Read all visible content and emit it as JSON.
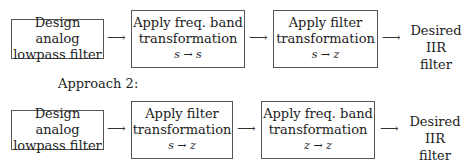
{
  "arrow_glyph": "⟶",
  "approach1": {
    "steps": [
      {
        "line1": "Design analog",
        "line2": "lowpass filter"
      },
      {
        "line1": "Apply freq. band",
        "line2": "transformation",
        "mapping": "s → s"
      },
      {
        "line1": "Apply filter",
        "line2": "transformation",
        "mapping": "s → z"
      }
    ],
    "output": {
      "line1": "Desired IIR",
      "line2": "filter"
    }
  },
  "approach2": {
    "heading": "Approach 2:",
    "steps": [
      {
        "line1": "Design analog",
        "line2": "lowpass filter"
      },
      {
        "line1": "Apply filter",
        "line2": "transformation",
        "mapping": "s → z"
      },
      {
        "line1": "Apply freq. band",
        "line2": "transformation",
        "mapping": "z → z"
      }
    ],
    "output": {
      "line1": "Desired IIR",
      "line2": "filter"
    }
  }
}
